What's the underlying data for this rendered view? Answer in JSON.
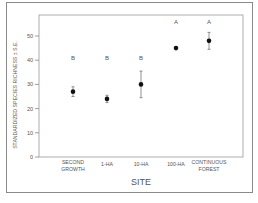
{
  "chart_data": {
    "type": "scatter",
    "title": "",
    "xlabel": "SITE",
    "ylabel": "STANDARDIZED SPECIES RICHNESS ± S.E.",
    "categories": [
      "SECOND GROWTH",
      "1-HA",
      "10-HA",
      "100-HA",
      "CONTINUOUS FOREST"
    ],
    "category_lines": [
      [
        "SECOND",
        "GROWTH"
      ],
      [
        "1-HA"
      ],
      [
        "10-HA"
      ],
      [
        "100-HA"
      ],
      [
        "CONTINUOUS",
        "FOREST"
      ]
    ],
    "values": [
      27,
      24,
      30,
      45,
      48
    ],
    "errors": [
      2,
      1.5,
      5.5,
      0.5,
      3.5
    ],
    "group_letters": [
      "B",
      "B",
      "B",
      "A",
      "A"
    ],
    "ylim": [
      0,
      55
    ],
    "yticks": [
      0,
      10,
      20,
      30,
      40,
      50
    ],
    "grid": false,
    "legend": null
  },
  "colors": {
    "marker": "#111111",
    "axis": "#888888",
    "text": "#555555"
  }
}
